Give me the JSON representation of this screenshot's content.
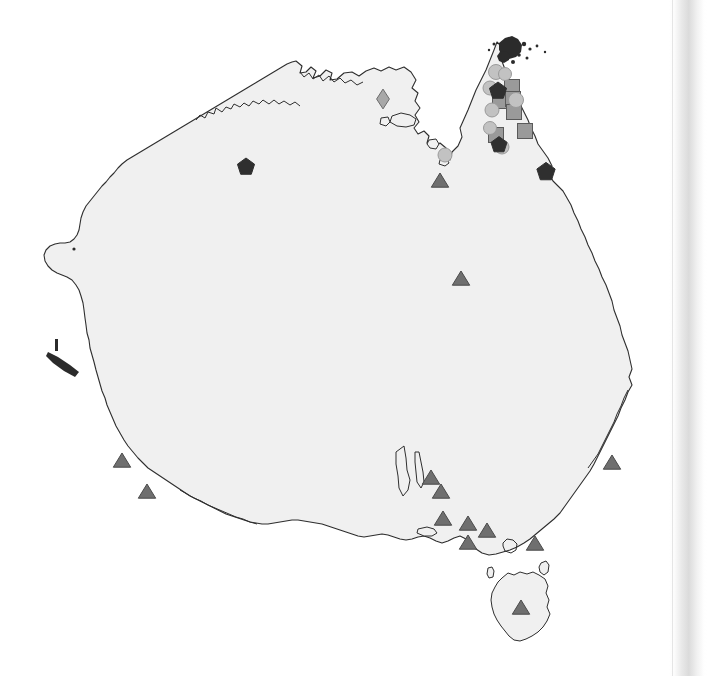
{
  "figure": {
    "region_label": "Australia",
    "background_color": "#ffffff",
    "land_fill_color": "#f0f0f0",
    "coast_outline_color": "#2e2e2e"
  },
  "symbols": {
    "triangle": {
      "name": "triangle",
      "color": "#6f6f6f",
      "stroke": "#4a4a4a"
    },
    "square": {
      "name": "square",
      "color": "#9a9a9a",
      "stroke": "#5a5a5a"
    },
    "circle": {
      "name": "circle",
      "color": "#c2c2c2",
      "stroke": "#9a9a9a"
    },
    "pentagon": {
      "name": "pentagon",
      "color": "#2f2f2f",
      "stroke": "#2f2f2f"
    },
    "diamond": {
      "name": "diamond",
      "color": "#a8a8a8",
      "stroke": "#6d6d6d"
    }
  },
  "markers": [
    {
      "id": "m01",
      "shape": "triangle",
      "x": 440,
      "y": 181,
      "size": 15
    },
    {
      "id": "m02",
      "shape": "triangle",
      "x": 461,
      "y": 279,
      "size": 15
    },
    {
      "id": "m03",
      "shape": "triangle",
      "x": 122,
      "y": 461,
      "size": 15
    },
    {
      "id": "m04",
      "shape": "triangle",
      "x": 147,
      "y": 492,
      "size": 15
    },
    {
      "id": "m05",
      "shape": "triangle",
      "x": 431,
      "y": 478,
      "size": 15
    },
    {
      "id": "m06",
      "shape": "triangle",
      "x": 441,
      "y": 492,
      "size": 15
    },
    {
      "id": "m07",
      "shape": "triangle",
      "x": 443,
      "y": 519,
      "size": 15
    },
    {
      "id": "m08",
      "shape": "triangle",
      "x": 468,
      "y": 524,
      "size": 15
    },
    {
      "id": "m09",
      "shape": "triangle",
      "x": 487,
      "y": 531,
      "size": 15
    },
    {
      "id": "m10",
      "shape": "triangle",
      "x": 468,
      "y": 543,
      "size": 15
    },
    {
      "id": "m11",
      "shape": "triangle",
      "x": 535,
      "y": 544,
      "size": 15
    },
    {
      "id": "m12",
      "shape": "triangle",
      "x": 612,
      "y": 463,
      "size": 15
    },
    {
      "id": "m13",
      "shape": "triangle",
      "x": 521,
      "y": 608,
      "size": 15
    },
    {
      "id": "m14",
      "shape": "square",
      "x": 512,
      "y": 87,
      "size": 15
    },
    {
      "id": "m15",
      "shape": "square",
      "x": 500,
      "y": 101,
      "size": 15
    },
    {
      "id": "m16",
      "shape": "square",
      "x": 513,
      "y": 99,
      "size": 15
    },
    {
      "id": "m17",
      "shape": "square",
      "x": 514,
      "y": 112,
      "size": 15
    },
    {
      "id": "m18",
      "shape": "square",
      "x": 496,
      "y": 135,
      "size": 15
    },
    {
      "id": "m19",
      "shape": "square",
      "x": 525,
      "y": 131,
      "size": 15
    },
    {
      "id": "m20",
      "shape": "circle",
      "x": 496,
      "y": 72,
      "size": 15
    },
    {
      "id": "m21",
      "shape": "circle",
      "x": 505,
      "y": 74,
      "size": 13
    },
    {
      "id": "m22",
      "shape": "circle",
      "x": 490,
      "y": 88,
      "size": 14
    },
    {
      "id": "m23",
      "shape": "circle",
      "x": 516,
      "y": 100,
      "size": 15
    },
    {
      "id": "m24",
      "shape": "circle",
      "x": 492,
      "y": 110,
      "size": 14
    },
    {
      "id": "m25",
      "shape": "circle",
      "x": 490,
      "y": 128,
      "size": 13
    },
    {
      "id": "m26",
      "shape": "circle",
      "x": 502,
      "y": 147,
      "size": 14
    },
    {
      "id": "m27",
      "shape": "circle",
      "x": 445,
      "y": 155,
      "size": 14
    },
    {
      "id": "m28",
      "shape": "pentagon",
      "x": 246,
      "y": 167,
      "size": 15
    },
    {
      "id": "m29",
      "shape": "pentagon",
      "x": 498,
      "y": 91,
      "size": 15
    },
    {
      "id": "m30",
      "shape": "pentagon",
      "x": 499,
      "y": 145,
      "size": 14
    },
    {
      "id": "m31",
      "shape": "pentagon",
      "x": 546,
      "y": 172,
      "size": 16
    },
    {
      "id": "m32",
      "shape": "diamond",
      "x": 383,
      "y": 99,
      "size": 16
    }
  ],
  "marker_counts": {
    "triangle": 13,
    "square": 6,
    "circle": 8,
    "pentagon": 4,
    "diamond": 1,
    "total": 32
  },
  "page_edge": {
    "present": true,
    "side": "right",
    "description": "scanned page edge shadow gradient"
  }
}
